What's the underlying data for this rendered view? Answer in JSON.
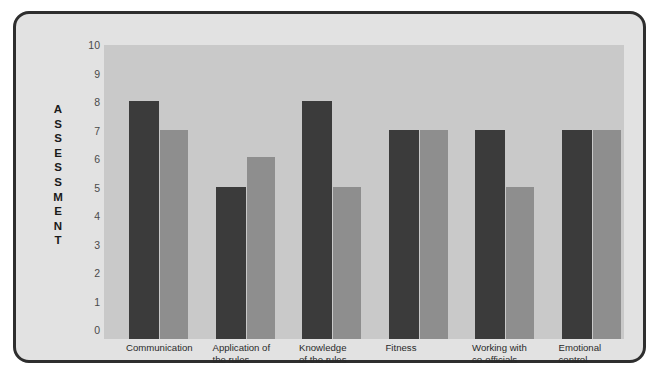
{
  "chart_data": {
    "type": "bar",
    "title": "",
    "xlabel": "",
    "ylabel": "ASSESSMENT",
    "ylim": [
      0,
      10
    ],
    "yticks": [
      10,
      9,
      8,
      7,
      6,
      5,
      4,
      3,
      2,
      1,
      0
    ],
    "grid": false,
    "legend_position": "none",
    "categories": [
      "Communication",
      "Application of the rules",
      "Knowledge of the rules",
      "Fitness",
      "Working with co-officials",
      "Emotional control"
    ],
    "category_lines": [
      [
        "Communication"
      ],
      [
        "Application of",
        "the rules"
      ],
      [
        "Knowledge",
        "of the rules"
      ],
      [
        "Fitness"
      ],
      [
        "Working with",
        "co-officials"
      ],
      [
        "Emotional",
        "control"
      ]
    ],
    "series": [
      {
        "name": "dark",
        "color": "#3b3b3b",
        "values": [
          8.35,
          5.35,
          8.35,
          7.35,
          7.35,
          7.35
        ]
      },
      {
        "name": "light",
        "color": "#8e8e8e",
        "values": [
          7.35,
          6.4,
          5.35,
          7.35,
          5.35,
          7.35
        ]
      }
    ],
    "colors": {
      "plot_background": "#c9c9c9",
      "panel_background": "#e2e2e2",
      "frame": "#2e2e2e",
      "page_background": "#ffffff",
      "tick_text": "#4a4a4a",
      "label_text": "#1a1a1a"
    }
  },
  "axis": {
    "ylabel_letters": [
      "A",
      "S",
      "S",
      "E",
      "S",
      "S",
      "M",
      "E",
      "N",
      "T"
    ]
  }
}
